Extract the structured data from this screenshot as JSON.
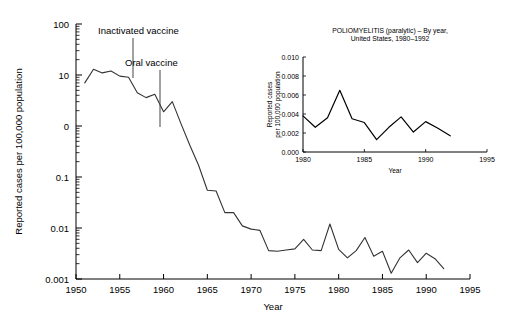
{
  "main": {
    "y_axis_title": "Reported cases per 100,000 population",
    "x_axis_title": "Year",
    "y_ticks": [
      "100",
      "10",
      "0",
      "0.1",
      "0.01",
      "0.001"
    ],
    "x_ticks": [
      "1950",
      "1955",
      "1960",
      "1965",
      "1970",
      "1975",
      "1980",
      "1985",
      "1990",
      "1995"
    ],
    "annotations": [
      {
        "label": "Inactivated vaccine",
        "year": 1955
      },
      {
        "label": "Oral vaccine",
        "year": 1961
      }
    ]
  },
  "inset": {
    "title_line1": "POLIOMYELITIS (paralytic) – By year,",
    "title_line2": "United States, 1980–1992",
    "y_axis_title_line1": "Reported cases",
    "y_axis_title_line2": "per 100,000 population",
    "x_axis_title": "Year",
    "y_ticks": [
      "0.010",
      "0.008",
      "0.006",
      "0.004",
      "0.002",
      "0.000"
    ],
    "x_ticks": [
      "1980",
      "1985",
      "1990",
      "1995"
    ]
  },
  "colors": {
    "axis": "#000000",
    "series_main": "#333333",
    "series_inset": "#000000",
    "annotation": "#444444",
    "background": "#ffffff"
  },
  "chart_data": [
    {
      "type": "line",
      "id": "main-poliomyelitis-log",
      "title": "",
      "xlabel": "Year",
      "ylabel": "Reported cases per 100,000 population",
      "yscale": "log",
      "ylim": [
        0.001,
        100
      ],
      "xlim": [
        1950,
        1995
      ],
      "ytick_values": [
        100,
        10,
        1,
        0.1,
        0.01,
        0.001
      ],
      "ytick_labels": [
        "100",
        "10",
        "0",
        "0.1",
        "0.01",
        "0.001"
      ],
      "xtick_values": [
        1950,
        1955,
        1960,
        1965,
        1970,
        1975,
        1980,
        1985,
        1990,
        1995
      ],
      "grid": false,
      "legend": false,
      "annotations": [
        {
          "text": "Inactivated vaccine",
          "x": 1955,
          "y": 10
        },
        {
          "text": "Oral vaccine",
          "x": 1961,
          "y": 0.9
        }
      ],
      "x": [
        1951,
        1952,
        1953,
        1954,
        1955,
        1956,
        1957,
        1958,
        1959,
        1960,
        1961,
        1962,
        1963,
        1964,
        1965,
        1966,
        1967,
        1968,
        1969,
        1970,
        1971,
        1972,
        1973,
        1974,
        1975,
        1976,
        1977,
        1978,
        1979,
        1980,
        1981,
        1982,
        1983,
        1984,
        1985,
        1986,
        1987,
        1988,
        1989,
        1990,
        1991,
        1992
      ],
      "y": [
        7.0,
        13.0,
        11.0,
        12.0,
        9.5,
        9.0,
        4.5,
        3.6,
        4.2,
        1.9,
        3.0,
        1.1,
        0.42,
        0.17,
        0.055,
        0.053,
        0.02,
        0.02,
        0.011,
        0.0095,
        0.009,
        0.0036,
        0.0035,
        0.0037,
        0.0039,
        0.006,
        0.0037,
        0.0036,
        0.012,
        0.0038,
        0.0026,
        0.0036,
        0.0065,
        0.0028,
        0.0035,
        0.0013,
        0.0026,
        0.0037,
        0.0021,
        0.0032,
        0.0025,
        0.0016
      ]
    },
    {
      "type": "line",
      "id": "inset-poliomyelitis-linear",
      "title": "POLIOMYELITIS (paralytic) – By year, United States, 1980–1992",
      "xlabel": "Year",
      "ylabel": "Reported cases per 100,000 population",
      "yscale": "linear",
      "ylim": [
        0.0,
        0.01
      ],
      "xlim": [
        1980,
        1995
      ],
      "ytick_values": [
        0.01,
        0.008,
        0.006,
        0.004,
        0.002,
        0.0
      ],
      "ytick_labels": [
        "0.010",
        "0.008",
        "0.006",
        "0.004",
        "0.002",
        "0.000"
      ],
      "xtick_values": [
        1980,
        1985,
        1990,
        1995
      ],
      "grid": false,
      "legend": false,
      "x": [
        1980,
        1981,
        1982,
        1983,
        1984,
        1985,
        1986,
        1987,
        1988,
        1989,
        1990,
        1991,
        1992
      ],
      "y": [
        0.0038,
        0.0026,
        0.0036,
        0.0065,
        0.0035,
        0.0031,
        0.0013,
        0.0026,
        0.0037,
        0.0021,
        0.0032,
        0.0025,
        0.0017
      ]
    }
  ]
}
